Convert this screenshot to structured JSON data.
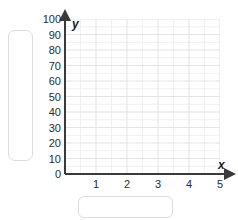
{
  "chart_data": {
    "type": "scatter",
    "title": "",
    "xlabel": "x",
    "ylabel": "y",
    "xlim": [
      0,
      5
    ],
    "ylim": [
      0,
      100
    ],
    "x_ticks": [
      "1",
      "2",
      "3",
      "4",
      "5"
    ],
    "y_ticks": [
      "100",
      "90",
      "80",
      "70",
      "60",
      "50",
      "40",
      "30",
      "20",
      "10",
      "0"
    ],
    "x_tick_values": [
      1,
      2,
      3,
      4,
      5
    ],
    "y_tick_values": [
      100,
      90,
      80,
      70,
      60,
      50,
      40,
      30,
      20,
      10,
      0
    ],
    "grid": true,
    "grid_major_color": "#e3e3e8",
    "grid_minor_color": "#f0f0f4",
    "axis_color": "#3a3a3a",
    "legend": [],
    "series": [],
    "x": [],
    "values": [],
    "annotations": []
  },
  "axes": {
    "y_axis_label": "y",
    "x_axis_label": "x",
    "axis_color": "#3a3a3a"
  },
  "inputs": {
    "y_label_box": {
      "value": "",
      "placeholder": ""
    },
    "x_label_box": {
      "value": "",
      "placeholder": ""
    }
  }
}
